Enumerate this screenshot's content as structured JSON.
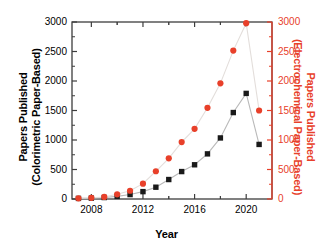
{
  "chart_data": {
    "type": "line",
    "title": "",
    "xlabel": "Year",
    "ylabel": "Papers Published (Colorimetric Paper-Based)",
    "ylabel_right": "Papers Published (Electrochemical Paper-Based)",
    "x": [
      2007,
      2008,
      2009,
      2010,
      2011,
      2012,
      2013,
      2014,
      2015,
      2016,
      2017,
      2018,
      2019,
      2020,
      2021
    ],
    "xlim": [
      2006.5,
      2022.0
    ],
    "ylim": [
      0,
      3000
    ],
    "ylim_right": [
      0,
      3000
    ],
    "xticks": [
      2008,
      2012,
      2016,
      2020
    ],
    "xtick_labels": [
      "2008",
      "2012",
      "2016",
      "2020"
    ],
    "yticks": [
      0,
      500,
      1000,
      1500,
      2000,
      2500,
      3000
    ],
    "ytick_labels": [
      "0",
      "500",
      "1000",
      "1500",
      "2000",
      "2500",
      "3000"
    ],
    "yticks_right": [
      0,
      500,
      1000,
      1500,
      2000,
      2500,
      3000
    ],
    "ytick_labels_right": [
      "0",
      "500",
      "1000",
      "1500",
      "2000",
      "2500",
      "3000"
    ],
    "grid": false,
    "legend": "none",
    "series": [
      {
        "name": "Colorimetric Paper-Based",
        "axis": "left",
        "marker": "square",
        "color": "#1a1a1a",
        "line_color": "#b9b9b9",
        "values": [
          10,
          15,
          25,
          45,
          75,
          125,
          200,
          330,
          465,
          580,
          765,
          1035,
          1465,
          1790,
          925
        ]
      },
      {
        "name": "Electrochemical Paper-Based",
        "axis": "right",
        "marker": "circle",
        "color": "#E8402A",
        "line_color": "#e3dedb",
        "values": [
          12,
          20,
          35,
          80,
          140,
          260,
          470,
          690,
          965,
          1190,
          1545,
          1960,
          2515,
          2980,
          1500
        ]
      }
    ]
  },
  "axes": {
    "left_title_line1": "Papers Published",
    "left_title_line2": "(Colorimetric Paper-Based)",
    "right_title_line1": "Papers Published",
    "right_title_line2": "(Electrochemical Paper-Based)",
    "x_title": "Year"
  },
  "colors": {
    "red": "#E8402A",
    "black": "#1a1a1a",
    "frame": "#3d3d3d",
    "line_gray": "#c4c0be"
  }
}
